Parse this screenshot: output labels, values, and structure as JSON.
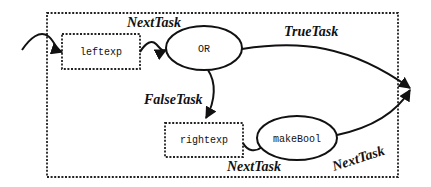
{
  "diagram": {
    "type": "task-flow",
    "container": {
      "style": "dashed"
    },
    "nodes": {
      "leftexp": {
        "label": "leftexp",
        "shape": "dashed-rectangle"
      },
      "or": {
        "label": "OR",
        "shape": "ellipse"
      },
      "rightexp": {
        "label": "rightexp",
        "shape": "dashed-rectangle"
      },
      "makebool": {
        "label": "makeBool",
        "shape": "ellipse"
      }
    },
    "edges": {
      "entry": {
        "from": "outside",
        "to": "leftexp",
        "label": ""
      },
      "leftexp_or": {
        "from": "leftexp",
        "to": "OR",
        "label": "NextTask"
      },
      "or_true": {
        "from": "OR",
        "to": "exit",
        "label": "TrueTask"
      },
      "or_false": {
        "from": "OR",
        "to": "rightexp",
        "label": "FalseTask"
      },
      "rightexp_makebool": {
        "from": "rightexp",
        "to": "makeBool",
        "label": "NextTask"
      },
      "makebool_exit": {
        "from": "makeBool",
        "to": "exit",
        "label": "NextTask"
      }
    }
  }
}
